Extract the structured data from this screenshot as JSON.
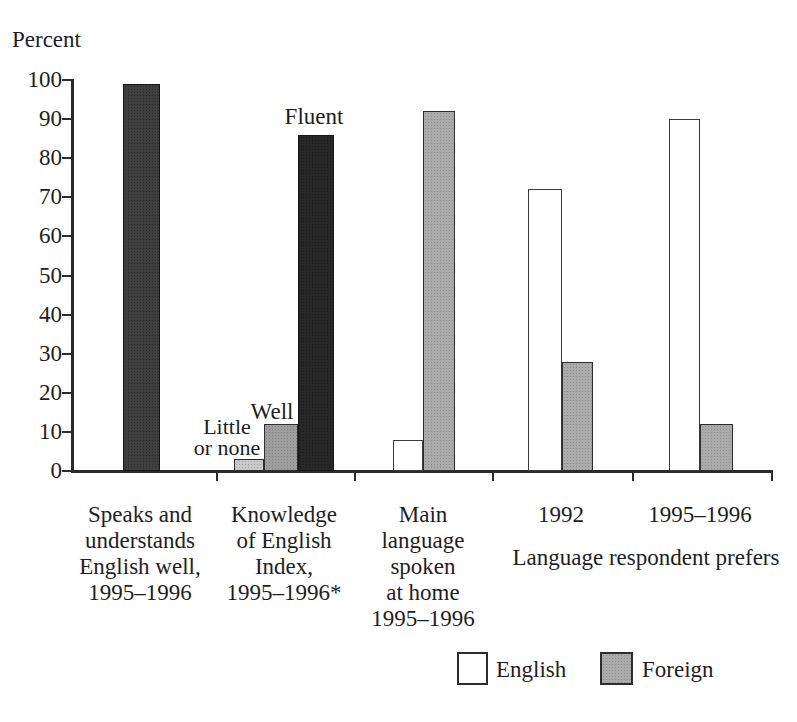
{
  "colors": {
    "background": "#ffffff",
    "axis": "#2b2b2b",
    "text": "#1e1e1e",
    "bar_dark": "#3f3f3f",
    "bar_black": "#272727",
    "bar_light_gray": "#c9c9c9",
    "bar_medium_gray": "#9e9e9e",
    "bar_english": "#ffffff",
    "bar_foreign": "#ababab"
  },
  "chart_data": {
    "type": "bar",
    "title": "",
    "xlabel": "",
    "ylabel": "Percent",
    "ylim": [
      0,
      100
    ],
    "yticks": [
      0,
      10,
      20,
      30,
      40,
      50,
      60,
      70,
      80,
      90,
      100
    ],
    "grid": false,
    "legend_position": "bottom-right",
    "groups": [
      {
        "label": "Speaks and understands English well, 1995–1996",
        "label_lines": [
          "Speaks and",
          "understands",
          "English well,",
          "1995–1996"
        ],
        "bars": [
          {
            "label": "Speaks and understands English well",
            "value": 99,
            "style": "dark"
          }
        ]
      },
      {
        "label": "Knowledge of English Index, 1995–1996*",
        "label_lines": [
          "Knowledge",
          "of English",
          "Index,",
          "1995–1996*"
        ],
        "bars": [
          {
            "label": "Little or none",
            "value": 3,
            "style": "light_gray"
          },
          {
            "label": "Well",
            "value": 12,
            "style": "medium_gray"
          },
          {
            "label": "Fluent",
            "value": 86,
            "style": "black"
          }
        ]
      },
      {
        "label": "Main language spoken at home 1995–1996",
        "label_lines": [
          "Main",
          "language",
          "spoken",
          "at home",
          "1995–1996"
        ],
        "bars": [
          {
            "label": "English",
            "value": 8,
            "style": "english"
          },
          {
            "label": "Foreign",
            "value": 92,
            "style": "foreign"
          }
        ]
      },
      {
        "label": "1992",
        "label_lines": [
          "1992"
        ],
        "bars": [
          {
            "label": "English",
            "value": 72,
            "style": "english"
          },
          {
            "label": "Foreign",
            "value": 28,
            "style": "foreign"
          }
        ]
      },
      {
        "label": "1995–1996",
        "label_lines": [
          "1995–1996"
        ],
        "bars": [
          {
            "label": "English",
            "value": 90,
            "style": "english"
          },
          {
            "label": "Foreign",
            "value": 12,
            "style": "foreign"
          }
        ]
      }
    ],
    "group_footer": "Language respondent prefers",
    "annotations": {
      "little_or_none_lines": [
        "Little",
        "or none"
      ],
      "well": "Well",
      "fluent": "Fluent"
    },
    "legend": [
      {
        "label": "English",
        "style": "english"
      },
      {
        "label": "Foreign",
        "style": "foreign"
      }
    ]
  }
}
